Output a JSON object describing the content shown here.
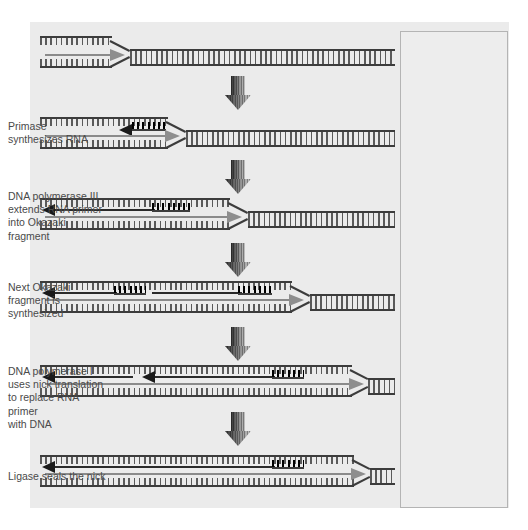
{
  "figure": {
    "background_color": "#ffffff",
    "panel_color": "#ebebeb",
    "textbox_color": "#ededed",
    "textbox_border_color": "#b4b4b4",
    "caption_color": "#4a4a4a",
    "leading_arrow_color": "#8e8e8e",
    "lagging_arrow_color": "#1a1a1a",
    "rna_primer_color": "#000000",
    "dna_backbone_color": "#3c3c3c"
  },
  "captions": [
    {
      "id": "step1",
      "text": "",
      "top": 0
    },
    {
      "id": "step2",
      "text": "Primase\nsynthesizes RNA",
      "top": 120
    },
    {
      "id": "step3",
      "text": "DNA polymerase III\nextends RNA primer\ninto Okazaki fragment",
      "top": 190
    },
    {
      "id": "step4",
      "text": "Next Okazaki\nfragment is\nsynthesized",
      "top": 281
    },
    {
      "id": "step5",
      "text": "DNA polymerase I\nuses nick translation\nto replace RNA primer\nwith DNA",
      "top": 365
    },
    {
      "id": "step6",
      "text": "Ligase seals the nick",
      "top": 470
    }
  ],
  "caption_lines": {
    "step2": [
      "Primase",
      "synthesizes RNA"
    ],
    "step3": [
      "DNA polymerase III",
      "extends RNA primer",
      "into Okazaki fragment"
    ],
    "step4": [
      "Next Okazaki",
      "fragment is",
      "synthesized"
    ],
    "step5": [
      "DNA polymerase I",
      "uses nick translation",
      "to replace RNA primer",
      "with DNA"
    ],
    "step6": [
      "Ligase seals the nick"
    ]
  },
  "panels": [
    {
      "id": "panel-1",
      "label": "unwound replication fork",
      "fork_x": 110,
      "leading_arrow": true,
      "lagging_arrows": 0,
      "rna_primers": 0
    },
    {
      "id": "panel-2",
      "label": "primase synthesizes RNA primer",
      "fork_x": 165,
      "leading_arrow": true,
      "lagging_arrows": 1,
      "rna_primers": 1
    },
    {
      "id": "panel-3",
      "label": "DNA polymerase III extends primer into Okazaki fragment",
      "fork_x": 228,
      "leading_arrow": true,
      "lagging_arrows": 1,
      "rna_primers": 1
    },
    {
      "id": "panel-4",
      "label": "next Okazaki fragment synthesized",
      "fork_x": 290,
      "leading_arrow": true,
      "lagging_arrows": 1,
      "rna_primers": 2
    },
    {
      "id": "panel-5",
      "label": "nick translation replaces RNA with DNA",
      "fork_x": 350,
      "leading_arrow": true,
      "lagging_arrows": 2,
      "rna_primers": 1
    },
    {
      "id": "panel-6",
      "label": "ligase seals the nick",
      "fork_x": 352,
      "leading_arrow": true,
      "lagging_arrows": 1,
      "rna_primers": 1
    }
  ],
  "transition_arrows": [
    {
      "id": "transition-1",
      "top": 76
    },
    {
      "id": "transition-2",
      "top": 160
    },
    {
      "id": "transition-3",
      "top": 243
    },
    {
      "id": "transition-4",
      "top": 327
    },
    {
      "id": "transition-5",
      "top": 412
    }
  ]
}
